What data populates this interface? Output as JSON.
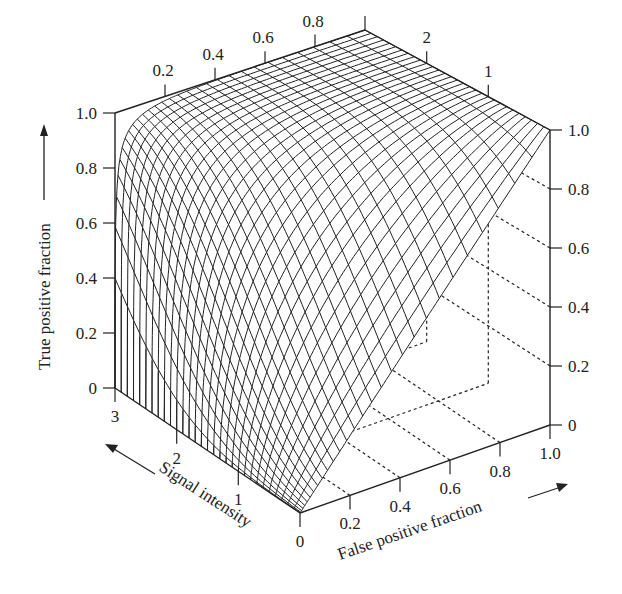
{
  "chart_data": {
    "type": "surface3d",
    "title": "",
    "axes": {
      "x": {
        "label": "False positive fraction",
        "ticks": [
          "0",
          "0.2",
          "0.4",
          "0.6",
          "0.8",
          "1.0"
        ],
        "range": [
          0,
          1.0
        ]
      },
      "y": {
        "label": "Signal intensity",
        "ticks": [
          "0",
          "1",
          "2",
          "3"
        ],
        "range": [
          0,
          3
        ]
      },
      "z": {
        "label": "True positive fraction",
        "ticks": [
          "0",
          "0.2",
          "0.4",
          "0.6",
          "0.8",
          "1.0"
        ],
        "range": [
          0,
          1.0
        ]
      }
    },
    "top_edge_ticks_fpf": [
      "0.2",
      "0.4",
      "0.6",
      "0.8"
    ],
    "top_edge_ticks_signal": [
      "2",
      "1"
    ],
    "surface_samples": {
      "signal_intensity": [
        0,
        1,
        2,
        3
      ],
      "fpf": [
        0,
        0.2,
        0.4,
        0.6,
        0.8,
        1.0
      ],
      "tpf": [
        [
          0,
          0.2,
          0.4,
          0.6,
          0.8,
          1.0
        ],
        [
          0,
          0.55,
          0.76,
          0.89,
          0.96,
          1.0
        ],
        [
          0,
          0.86,
          0.95,
          0.98,
          0.995,
          1.0
        ],
        [
          0,
          0.98,
          0.995,
          0.999,
          1.0,
          1.0
        ]
      ]
    },
    "mesh": {
      "fpf_steps": 30,
      "signal_steps": 30
    },
    "grid": "dotted back walls",
    "colors": {
      "line": "#222222",
      "background": "#ffffff"
    }
  },
  "labels": {
    "z_axis_title": "True positive fraction",
    "x_axis_title": "False positive fraction",
    "y_axis_title": "Signal intensity"
  }
}
